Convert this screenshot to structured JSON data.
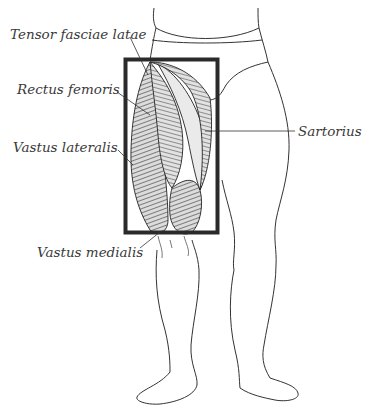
{
  "diagram": {
    "highlight_box_color": "#2a2a2a",
    "labels": [
      {
        "id": "tensor",
        "text": "Tensor fasciae latae",
        "x": 10,
        "y": 28
      },
      {
        "id": "rectus",
        "text": "Rectus femoris",
        "x": 17,
        "y": 83
      },
      {
        "id": "vastus_lat",
        "text": "Vastus lateralis",
        "x": 13,
        "y": 141
      },
      {
        "id": "sartorius",
        "text": "Sartorius",
        "x": 298,
        "y": 127
      },
      {
        "id": "vastus_med",
        "text": "Vastus medialis",
        "x": 37,
        "y": 248
      }
    ]
  }
}
